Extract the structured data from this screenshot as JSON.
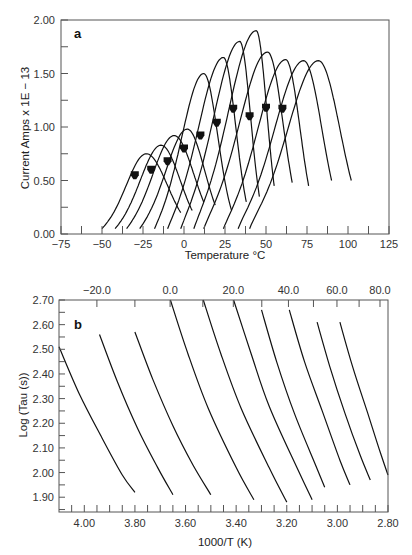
{
  "chart_data": [
    {
      "panel": "a",
      "type": "line",
      "title": "",
      "xlabel": "Temperature °C",
      "ylabel": "Current Amps x 1E − 13",
      "xlim": [
        -75,
        125
      ],
      "ylim": [
        0.0,
        2.0
      ],
      "xticks": [
        -75,
        -50,
        -25,
        0,
        25,
        50,
        75,
        100,
        125
      ],
      "xtick_labels": [
        "−75",
        "−50",
        "−25",
        "0",
        "25",
        "50",
        "75",
        "100",
        "125"
      ],
      "yticks": [
        0.0,
        0.5,
        1.0,
        1.5,
        2.0
      ],
      "ytick_labels": [
        "0.00",
        "0.50",
        "1.00",
        "1.50",
        "2.00"
      ],
      "grid": false,
      "legend": null,
      "series": [
        {
          "name": "peak 1",
          "start": -50,
          "peak_x": -23,
          "peak_y": 0.75,
          "end": -2,
          "end_y": 0.2
        },
        {
          "name": "peak 2",
          "start": -42,
          "peak_x": -14,
          "peak_y": 0.83,
          "end": 5,
          "end_y": 0.22
        },
        {
          "name": "peak 3",
          "start": -35,
          "peak_x": -6,
          "peak_y": 0.92,
          "end": 12,
          "end_y": 0.3
        },
        {
          "name": "peak 4",
          "start": -27,
          "peak_x": 2,
          "peak_y": 0.98,
          "end": 19,
          "end_y": 0.27
        },
        {
          "name": "peak 5",
          "start": -18,
          "peak_x": 12,
          "peak_y": 1.5,
          "end": 29,
          "end_y": 0.22
        },
        {
          "name": "peak 6",
          "start": -10,
          "peak_x": 24,
          "peak_y": 1.65,
          "end": 38,
          "end_y": 0.3
        },
        {
          "name": "peak 7",
          "start": -2,
          "peak_x": 34,
          "peak_y": 1.8,
          "end": 46,
          "end_y": 0.35
        },
        {
          "name": "peak 8",
          "start": 6,
          "peak_x": 44,
          "peak_y": 1.9,
          "end": 55,
          "end_y": 0.45
        },
        {
          "name": "peak 9",
          "start": 12,
          "peak_x": 51,
          "peak_y": 1.7,
          "end": 66,
          "end_y": 0.48
        },
        {
          "name": "peak 10",
          "start": 24,
          "peak_x": 62,
          "peak_y": 1.63,
          "end": 76,
          "end_y": 0.45
        },
        {
          "name": "peak 11",
          "start": 33,
          "peak_x": 73,
          "peak_y": 1.62,
          "end": 90,
          "end_y": 0.5
        },
        {
          "name": "peak 12",
          "start": 40,
          "peak_x": 82,
          "peak_y": 1.62,
          "end": 102,
          "end_y": 0.5
        }
      ],
      "markers": {
        "name": "polarization temperature arrows",
        "x": [
          -30,
          -20,
          -10,
          0,
          10,
          20,
          30,
          40,
          50,
          60
        ],
        "y": [
          0.55,
          0.6,
          0.68,
          0.8,
          0.92,
          1.04,
          1.17,
          1.1,
          1.18,
          1.17
        ]
      },
      "annotations": [
        "a"
      ]
    },
    {
      "panel": "b",
      "type": "line",
      "title": "",
      "xlabel": "1000/T (K)",
      "ylabel": "Log (Tau (s))",
      "xlim": [
        4.1,
        2.8
      ],
      "ylim": [
        1.84,
        2.7
      ],
      "xticks": [
        4.0,
        3.8,
        3.6,
        3.4,
        3.2,
        3.0,
        2.8
      ],
      "xtick_labels": [
        "4.00",
        "3.80",
        "3.60",
        "3.40",
        "3.20",
        "3.00",
        "2.80"
      ],
      "secondary_xaxis": {
        "position": "top",
        "label": "Temperature °C",
        "ticks": [
          -20.0,
          0.0,
          20.0,
          40.0,
          60.0,
          80.0
        ],
        "tick_labels": [
          "−20.0",
          "0.0",
          "20.0",
          "40.0",
          "60.0",
          "80.0"
        ]
      },
      "yticks": [
        1.9,
        2.0,
        2.1,
        2.2,
        2.3,
        2.4,
        2.5,
        2.6,
        2.7
      ],
      "ytick_labels": [
        "1.90",
        "2.00",
        "2.10",
        "2.20",
        "2.30",
        "2.40",
        "2.50",
        "2.60",
        "2.70"
      ],
      "grid": false,
      "legend": null,
      "series": [
        {
          "name": "relaxation 1",
          "x": [
            4.1,
            4.02,
            3.93,
            3.85,
            3.8
          ],
          "y": [
            2.51,
            2.32,
            2.14,
            1.99,
            1.92
          ]
        },
        {
          "name": "relaxation 2",
          "x": [
            3.94,
            3.87,
            3.79,
            3.71,
            3.65
          ],
          "y": [
            2.56,
            2.37,
            2.18,
            2.02,
            1.91
          ]
        },
        {
          "name": "relaxation 3",
          "x": [
            3.8,
            3.73,
            3.65,
            3.57,
            3.5
          ],
          "y": [
            2.57,
            2.38,
            2.19,
            2.03,
            1.91
          ]
        },
        {
          "name": "relaxation 4",
          "x": [
            3.66,
            3.59,
            3.51,
            3.4,
            3.33
          ],
          "y": [
            2.7,
            2.48,
            2.26,
            2.02,
            1.89
          ]
        },
        {
          "name": "relaxation 5",
          "x": [
            3.53,
            3.46,
            3.38,
            3.27,
            3.2
          ],
          "y": [
            2.7,
            2.48,
            2.26,
            2.02,
            1.88
          ]
        },
        {
          "name": "relaxation 6",
          "x": [
            3.41,
            3.34,
            3.27,
            3.16,
            3.1
          ],
          "y": [
            2.7,
            2.48,
            2.27,
            2.02,
            1.89
          ]
        },
        {
          "name": "relaxation 7",
          "x": [
            3.3,
            3.24,
            3.17,
            3.09,
            3.05
          ],
          "y": [
            2.66,
            2.45,
            2.24,
            2.04,
            1.94
          ]
        },
        {
          "name": "relaxation 8",
          "x": [
            3.19,
            3.13,
            3.06,
            2.99,
            2.95
          ],
          "y": [
            2.66,
            2.45,
            2.25,
            2.05,
            1.95
          ]
        },
        {
          "name": "relaxation 9",
          "x": [
            3.08,
            3.03,
            2.97,
            2.91,
            2.87
          ],
          "y": [
            2.61,
            2.43,
            2.24,
            2.07,
            1.97
          ]
        },
        {
          "name": "relaxation 10",
          "x": [
            2.99,
            2.94,
            2.88,
            2.83,
            2.8
          ],
          "y": [
            2.61,
            2.43,
            2.24,
            2.08,
            1.99
          ]
        }
      ],
      "annotations": [
        "b"
      ]
    }
  ],
  "figure": {
    "panel_a_label": "a",
    "panel_b_label": "b",
    "axis_color": "#555555",
    "curve_color": "#111111"
  }
}
